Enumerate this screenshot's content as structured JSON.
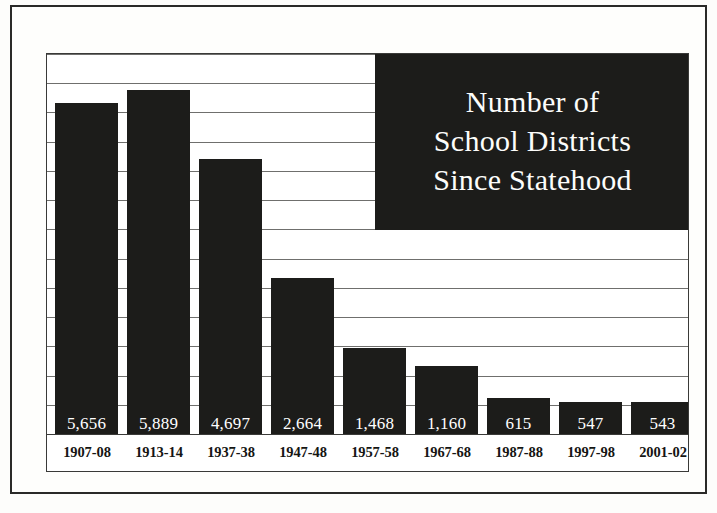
{
  "chart_data": {
    "type": "bar",
    "title": "Number of School Districts Since Statehood",
    "title_lines": [
      "Number of",
      "School Districts",
      "Since Statehood"
    ],
    "xlabel": "",
    "ylabel": "",
    "categories": [
      "1907-08",
      "1913-14",
      "1937-38",
      "1947-48",
      "1957-58",
      "1967-68",
      "1987-88",
      "1997-98",
      "2001-02"
    ],
    "values": [
      5656,
      5889,
      4697,
      2664,
      1468,
      1160,
      615,
      547,
      543
    ],
    "value_labels": [
      "5,656",
      "5,889",
      "4,697",
      "2,664",
      "1,468",
      "1,160",
      "615",
      "547",
      "543"
    ],
    "ylim": [
      0,
      6500
    ],
    "grid": true,
    "gridline_step": 500,
    "gridline_count": 13,
    "legend": "none",
    "orientation": "vertical",
    "bar_color": "#1c1c1a",
    "value_label_color": "#ffffff",
    "plot_background": "#ffffff"
  },
  "colors": {
    "ink": "#1c1c1a",
    "frame": "#2a2a28",
    "gridline": "#6f6f6d",
    "paper": "#fdfdfb",
    "plot_border": "#3a3a38"
  }
}
